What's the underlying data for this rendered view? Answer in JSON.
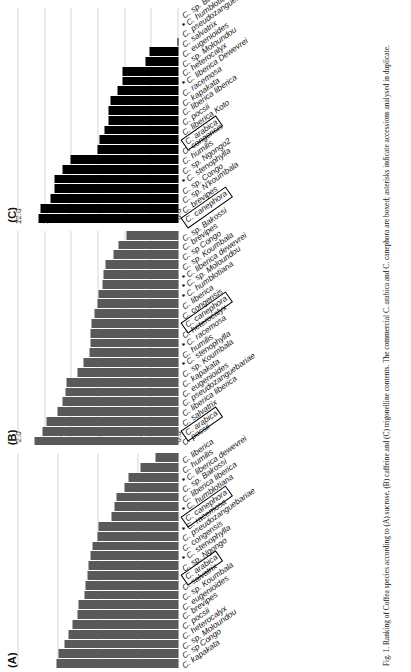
{
  "figure": {
    "caption": "Fig. 1. Ranking of Coffea species according to (A) sucrose, (B) caffeine and (C) trigonelline contents. The commercial C. arabica and C. canephora are boxed; asterisks indicate accessions analysed in duplicate."
  },
  "panels": [
    {
      "tag": "(A)",
      "color": "#595959",
      "axis": {
        "ticks": [
          "0.0",
          "0.5",
          "1.0",
          "1.5",
          "2.0"
        ],
        "min": 0.0,
        "max": 2.0
      },
      "categories": [
        "C. kapakata",
        "C. sp Congo",
        "C. sp. Moloundou",
        "C. heterocalyx",
        "C. pocsii",
        "C. brevipes",
        "C. eugenioides",
        "C. sp. Koumbala",
        "C. salvatrix",
        "C. arabica",
        "C. sp. Ngongo",
        "C. stenophylla",
        "C. congensis",
        "C. pseudozanguebariae",
        "C. racemosa",
        "C. canephora",
        "C. humblotiana",
        "C. liberica liberica",
        "C. sp. Bakossi",
        "C. liberica dewevrei",
        "C. humilis",
        "C. liberica"
      ],
      "values": [
        1.52,
        1.5,
        1.42,
        1.38,
        1.33,
        1.26,
        1.25,
        1.18,
        1.16,
        1.14,
        1.13,
        1.1,
        1.07,
        1.01,
        1.0,
        0.84,
        0.8,
        0.77,
        0.68,
        0.63,
        0.48,
        0.29
      ],
      "boxed": [
        "C. arabica",
        "C. canephora"
      ],
      "starred": [
        "C. stenophylla",
        "C. racemosa",
        "C. humblotiana",
        "C. liberica dewevrei"
      ]
    },
    {
      "tag": "(B)",
      "color": "#595959",
      "axis": {
        "ticks": [
          "0.0",
          "2.0",
          "4.0",
          "6.0",
          "8.0",
          "10.0",
          "12.0"
        ],
        "min": 0.0,
        "max": 12.0
      },
      "categories": [
        "C. pocsii",
        "C. arabica",
        "C. salvatrix",
        "C. liberica liberica",
        "C. pseudozanguebariae",
        "C. eugenioides",
        "C. kapakata",
        "C. sp. Koumbala",
        "C. stenophylla",
        "C. humilis",
        "C. racemosa",
        "C. heterocalyx",
        "C. canephora",
        "C. congensis",
        "C. liberica",
        "C. humblotiana",
        "C. sp. Moloundou",
        "C. liberica dewevrei",
        "C. sp. Koumbala",
        "C. sp Congo",
        "C. brevipes",
        "C. sp. Bakossi"
      ],
      "values": [
        10.8,
        10.2,
        9.9,
        9.1,
        8.7,
        8.5,
        8.4,
        7.6,
        7.1,
        6.7,
        6.6,
        6.6,
        6.5,
        6.3,
        6.1,
        6.0,
        5.7,
        5.6,
        5.5,
        4.9,
        4.5,
        3.9
      ],
      "boxed": [
        "C. arabica",
        "C. canephora"
      ],
      "starred": [
        "C. stenophylla",
        "C. racemosa",
        "C. humblotiana",
        "C. sp. Moloundou",
        "C. liberica dewevrei"
      ]
    },
    {
      "tag": "(C)",
      "color": "#000000",
      "axis": {
        "ticks": [
          "0.0",
          "0.5",
          "1.0",
          "1.5",
          "2.0",
          "2.5",
          "3.0"
        ],
        "min": 0.0,
        "max": 3.0
      },
      "categories": [
        "C. canephora",
        "C. brevipes",
        "C. sp. N'koumbala",
        "C. sp. Congo",
        "C. stenophylla",
        "C. sp. Ngongo2",
        "C. humilis",
        "C. congensis",
        "C. arabica",
        "C. liberica Koto",
        "C. pocsii",
        "C. liberica liberica",
        "C. kapakata",
        "C. racemosa",
        "C. liberica Dewevrei",
        "C. heterocalyx",
        "C. sp. Moloundou",
        "C. eugenioides",
        "C. salvatrix",
        "C. pseudozanguebariae",
        "C. humblotiana",
        "C. sp. Bakossi"
      ],
      "values": [
        2.62,
        2.58,
        2.4,
        2.32,
        2.32,
        2.18,
        2.03,
        1.52,
        1.49,
        1.38,
        1.32,
        1.32,
        1.28,
        1.15,
        1.05,
        1.05,
        0.62,
        0.55,
        0.02,
        0.0,
        0.0,
        0.0
      ],
      "boxed": [
        "C. canephora",
        "C. arabica"
      ],
      "starred": [
        "C. stenophylla",
        "C. liberica Dewevrei",
        "C. humblotiana"
      ]
    }
  ]
}
